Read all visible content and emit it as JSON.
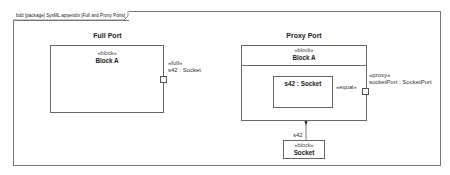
{
  "frame": {
    "header": "bdd [package] SysML appendix [Full and Proxy Ports]"
  },
  "full_port": {
    "title": "Full Port",
    "block": {
      "stereotype": "«block»",
      "name": "Block A"
    },
    "port": {
      "stereotype": "«full»",
      "label": "s42 : Socket"
    }
  },
  "proxy_port": {
    "title": "Proxy Port",
    "block": {
      "stereotype": "«block»",
      "name": "Block A"
    },
    "part": {
      "name": "s42 : Socket"
    },
    "connector": {
      "stereotype": "«equal»"
    },
    "port": {
      "stereotype": "«proxy»",
      "label": "socketPort : SocketPort"
    },
    "association": {
      "role": "s42"
    },
    "socket_block": {
      "stereotype": "«block»",
      "name": "Socket"
    }
  },
  "colors": {
    "line": "#666666",
    "background": "#ffffff",
    "text": "#222222"
  }
}
